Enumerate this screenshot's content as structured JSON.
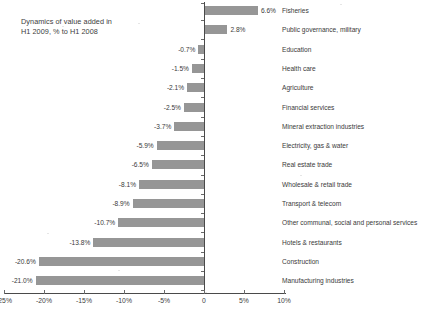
{
  "chart_data": {
    "type": "bar",
    "orientation": "horizontal",
    "title": "Dynamics of value added in\nH1 2009, % to H1 2008",
    "xlabel": "",
    "ylabel": "",
    "xlim": [
      -25,
      10
    ],
    "grid": false,
    "legend": null,
    "unit": "%",
    "bar_color": "#969696",
    "axis_color": "#4a4a4a",
    "categories": [
      "Fisheries",
      "Public governance, military",
      "Education",
      "Health care",
      "Agriculture",
      "Financial services",
      "Mineral extraction industries",
      "Electricity, gas & water",
      "Real estate trade",
      "Wholesale & retail trade",
      "Transport & telecom",
      "Other communal, social and personal services",
      "Hotels & restaurants",
      "Construction",
      "Manufacturing industries"
    ],
    "values": [
      6.6,
      2.8,
      -0.7,
      -1.5,
      -2.1,
      -2.5,
      -3.7,
      -5.9,
      -6.5,
      -8.1,
      -8.9,
      -10.7,
      -13.8,
      -20.6,
      -21.0
    ],
    "value_labels": [
      "6.6%",
      "2.8%",
      "-0.7%",
      "-1.5%",
      "-2.1%",
      "-2.5%",
      "-3.7%",
      "-5.9%",
      "-6.5%",
      "-8.1%",
      "-8.9%",
      "-10.7%",
      "-13.8%",
      "-20.6%",
      "-21.0%"
    ],
    "xticks": [
      -25,
      -20,
      -15,
      -10,
      -5,
      0,
      5,
      10
    ],
    "xtick_labels": [
      "-25%",
      "-20%",
      "-15%",
      "-10%",
      "-5%",
      "0",
      "5%",
      "10%"
    ]
  },
  "footer": {
    "text": ""
  }
}
